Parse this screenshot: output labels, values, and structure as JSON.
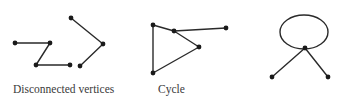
{
  "figures": [
    {
      "id": "disconnected",
      "label": "Disconnected vertices",
      "vertices": [
        [
          15,
          43
        ],
        [
          50,
          43
        ],
        [
          36,
          65
        ],
        [
          70,
          65
        ],
        [
          71,
          18
        ],
        [
          103,
          44
        ],
        [
          80,
          66
        ]
      ],
      "edges": [
        [
          0,
          1
        ],
        [
          1,
          2
        ],
        [
          2,
          3
        ],
        [
          4,
          5
        ],
        [
          5,
          6
        ]
      ]
    },
    {
      "id": "cycle",
      "label": "Cycle",
      "vertices": [
        [
          153,
          25
        ],
        [
          174,
          31
        ],
        [
          199,
          47
        ],
        [
          153,
          73
        ],
        [
          226,
          28
        ]
      ],
      "edges": [
        [
          0,
          1
        ],
        [
          1,
          2
        ],
        [
          2,
          3
        ],
        [
          3,
          0
        ],
        [
          1,
          4
        ]
      ]
    },
    {
      "id": "loop",
      "label": "",
      "loop": {
        "cx": 304,
        "cy": 32,
        "rx": 24,
        "ry": 17
      },
      "vertices": [
        [
          305,
          48
        ],
        [
          272,
          77
        ],
        [
          328,
          77
        ]
      ],
      "edges": [
        [
          0,
          1
        ],
        [
          0,
          2
        ]
      ]
    }
  ],
  "colors": {
    "edge": "#2a2a2a",
    "vertex": "#1a1a1a",
    "text": "#3a3a3a"
  }
}
